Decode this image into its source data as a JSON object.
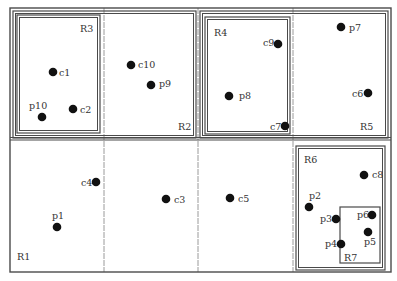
{
  "colors": {
    "line": "#4a4a4a",
    "grid": "#9a9a9a",
    "point": "#111111",
    "text": "#333333",
    "background": "#ffffff"
  },
  "diagram": {
    "outer_frame": {
      "x": 10,
      "y": 8,
      "w": 381,
      "h": 264
    },
    "horizontal_divider_y": 140,
    "vertical_dividers_x": [
      104,
      198,
      293
    ],
    "regions": [
      {
        "id": "R1",
        "label": "R1",
        "label_x": 17,
        "label_y": 260,
        "box": null
      },
      {
        "id": "R2",
        "label": "R2",
        "label_x": 178,
        "label_y": 130,
        "box": {
          "x": 13,
          "y": 11,
          "w": 183,
          "h": 127
        },
        "double": true
      },
      {
        "id": "R3",
        "label": "R3",
        "label_x": 80,
        "label_y": 32,
        "box": {
          "x": 17,
          "y": 15,
          "w": 83,
          "h": 118
        },
        "double": true
      },
      {
        "id": "R5",
        "label": "R5",
        "label_x": 360,
        "label_y": 130,
        "box": {
          "x": 200,
          "y": 11,
          "w": 188,
          "h": 127
        },
        "double": true
      },
      {
        "id": "R4",
        "label": "R4",
        "label_x": 214,
        "label_y": 36,
        "box": {
          "x": 205,
          "y": 17,
          "w": 85,
          "h": 117
        },
        "double": true
      },
      {
        "id": "R6",
        "label": "R6",
        "label_x": 304,
        "label_y": 163,
        "box": {
          "x": 296,
          "y": 146,
          "w": 89,
          "h": 124
        },
        "double": true
      },
      {
        "id": "R7",
        "label": "R7",
        "label_x": 344,
        "label_y": 261,
        "box": {
          "x": 340,
          "y": 207,
          "w": 40,
          "h": 56
        },
        "double": false
      }
    ],
    "points": [
      {
        "id": "c1",
        "label": "c1",
        "x": 53,
        "y": 72,
        "lx": 59,
        "ly": 76
      },
      {
        "id": "c2",
        "label": "c2",
        "x": 73,
        "y": 109,
        "lx": 80,
        "ly": 113
      },
      {
        "id": "p10",
        "label": "p10",
        "x": 42,
        "y": 117,
        "lx": 29,
        "ly": 109
      },
      {
        "id": "c10",
        "label": "c10",
        "x": 131,
        "y": 65,
        "lx": 138,
        "ly": 68
      },
      {
        "id": "p9",
        "label": "p9",
        "x": 151,
        "y": 85,
        "lx": 159,
        "ly": 87
      },
      {
        "id": "c9",
        "label": "c9",
        "x": 278,
        "y": 44,
        "lx": 263,
        "ly": 46
      },
      {
        "id": "p8",
        "label": "p8",
        "x": 229,
        "y": 96,
        "lx": 239,
        "ly": 99
      },
      {
        "id": "c7",
        "label": "c7",
        "x": 285,
        "y": 126,
        "lx": 270,
        "ly": 130
      },
      {
        "id": "p7",
        "label": "p7",
        "x": 341,
        "y": 27,
        "lx": 349,
        "ly": 31
      },
      {
        "id": "c6",
        "label": "c6",
        "x": 368,
        "y": 93,
        "lx": 352,
        "ly": 97
      },
      {
        "id": "c4",
        "label": "c4",
        "x": 96,
        "y": 182,
        "lx": 81,
        "ly": 186
      },
      {
        "id": "p1",
        "label": "p1",
        "x": 57,
        "y": 227,
        "lx": 52,
        "ly": 219
      },
      {
        "id": "c3",
        "label": "c3",
        "x": 166,
        "y": 199,
        "lx": 174,
        "ly": 203
      },
      {
        "id": "c5",
        "label": "c5",
        "x": 230,
        "y": 198,
        "lx": 238,
        "ly": 202
      },
      {
        "id": "c8",
        "label": "c8",
        "x": 364,
        "y": 175,
        "lx": 372,
        "ly": 178
      },
      {
        "id": "p2",
        "label": "p2",
        "x": 309,
        "y": 207,
        "lx": 309,
        "ly": 199
      },
      {
        "id": "p3",
        "label": "p3",
        "x": 336,
        "y": 219,
        "lx": 320,
        "ly": 222
      },
      {
        "id": "p6",
        "label": "p6",
        "x": 372,
        "y": 215,
        "lx": 357,
        "ly": 218
      },
      {
        "id": "p5",
        "label": "p5",
        "x": 368,
        "y": 232,
        "lx": 364,
        "ly": 245
      },
      {
        "id": "p4",
        "label": "p4",
        "x": 341,
        "y": 244,
        "lx": 325,
        "ly": 247
      }
    ]
  }
}
